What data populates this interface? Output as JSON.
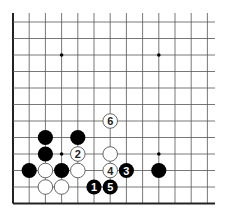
{
  "diagram": {
    "type": "go-board-fragment",
    "grid": {
      "x0": 13,
      "dx": 16.2,
      "cols": 13,
      "y0": 22,
      "dy": 16.5,
      "rows": 12,
      "top_extent": 13,
      "right_extent": 215,
      "left_edge_thick": true,
      "bottom_edge_thick": true
    },
    "colors": {
      "line": "#555555",
      "edge": "#222222",
      "black_stone": "#000000",
      "white_stone": "#ffffff",
      "white_stroke": "#555555"
    },
    "star_points": [
      {
        "col": 3,
        "row": 2
      },
      {
        "col": 9,
        "row": 2
      },
      {
        "col": 3,
        "row": 8
      },
      {
        "col": 9,
        "row": 8
      }
    ],
    "stones": [
      {
        "color": "black",
        "col": 2,
        "row": 7,
        "label": ""
      },
      {
        "color": "black",
        "col": 4,
        "row": 7,
        "label": ""
      },
      {
        "color": "black",
        "col": 2,
        "row": 8,
        "label": ""
      },
      {
        "color": "white",
        "col": 4,
        "row": 8,
        "label": "2"
      },
      {
        "color": "white",
        "col": 6,
        "row": 8,
        "label": ""
      },
      {
        "color": "black",
        "col": 1,
        "row": 9,
        "label": ""
      },
      {
        "color": "white",
        "col": 2,
        "row": 9,
        "label": ""
      },
      {
        "color": "black",
        "col": 3,
        "row": 9,
        "label": ""
      },
      {
        "color": "white",
        "col": 4,
        "row": 9,
        "label": ""
      },
      {
        "color": "white",
        "col": 6,
        "row": 9,
        "label": "4"
      },
      {
        "color": "black",
        "col": 7,
        "row": 9,
        "label": "3"
      },
      {
        "color": "black",
        "col": 9,
        "row": 9,
        "label": ""
      },
      {
        "color": "white",
        "col": 2,
        "row": 10,
        "label": ""
      },
      {
        "color": "white",
        "col": 3,
        "row": 10,
        "label": ""
      },
      {
        "color": "black",
        "col": 5,
        "row": 10,
        "label": "1"
      },
      {
        "color": "black",
        "col": 6,
        "row": 10,
        "label": "5"
      },
      {
        "color": "white",
        "col": 6,
        "row": 6,
        "label": "6"
      }
    ]
  }
}
